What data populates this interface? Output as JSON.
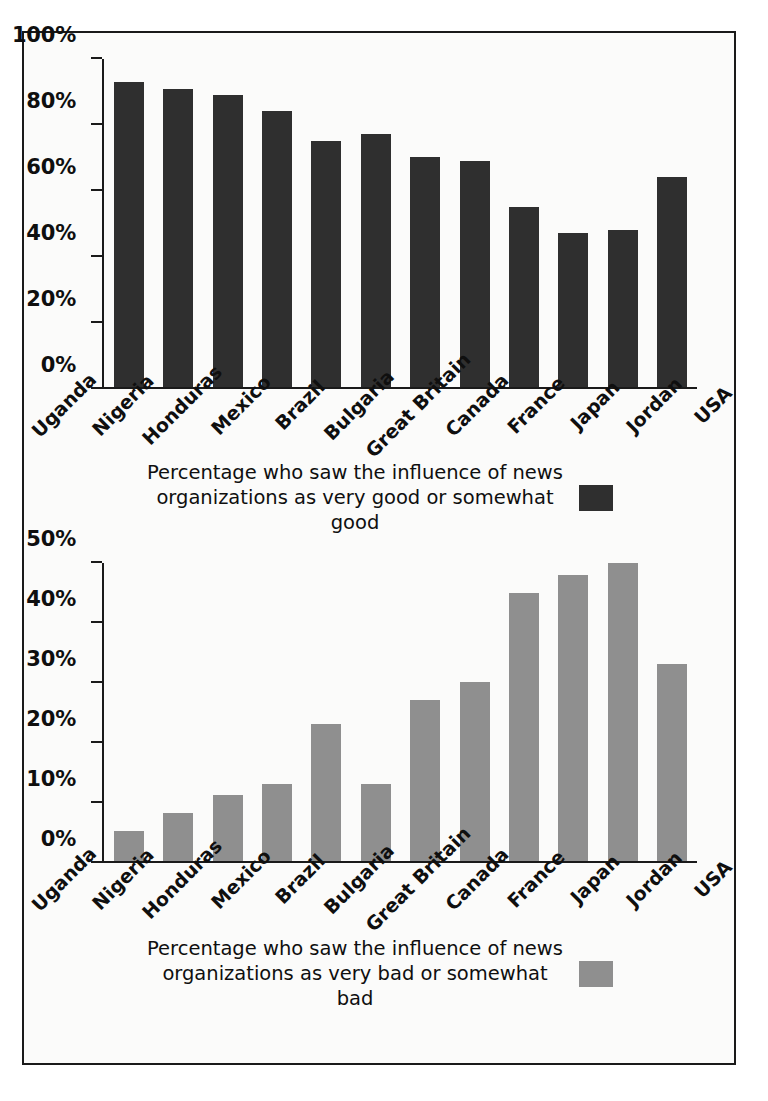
{
  "figure": {
    "background_color": "#fbfbfa",
    "border_color": "#1a1a1a"
  },
  "colors": {
    "series_good": "#2f2f2f",
    "series_bad": "#8f8f8f",
    "text": "#0f0f0f"
  },
  "legends": {
    "top_line1": "Percentage who saw the influence of news",
    "top_line2": "organizations as very good or somewhat good",
    "bottom_line1": "Percentage who saw the influence of news",
    "bottom_line2": "organizations as very bad or somewhat bad"
  },
  "chart_data": [
    {
      "type": "bar",
      "title": "",
      "xlabel": "",
      "ylabel": "",
      "ylim": [
        0,
        100
      ],
      "ytick_labels": [
        "100%",
        "80%",
        "60%",
        "40%",
        "20%",
        "0%"
      ],
      "ytick_values": [
        100,
        80,
        60,
        40,
        20,
        0
      ],
      "grid": false,
      "legend_position": "below",
      "legend_label": "Percentage who saw the influence of news organizations as very good or somewhat good",
      "bar_color": "#2f2f2f",
      "categories": [
        "Uganda",
        "Nigeria",
        "Honduras",
        "Mexico",
        "Brazil",
        "Bulgaria",
        "Great Britain",
        "Canada",
        "France",
        "Japan",
        "Jordan",
        "USA"
      ],
      "values": [
        93,
        91,
        89,
        84,
        75,
        77,
        70,
        69,
        55,
        47,
        48,
        64
      ]
    },
    {
      "type": "bar",
      "title": "",
      "xlabel": "",
      "ylabel": "",
      "ylim": [
        0,
        50
      ],
      "ytick_labels": [
        "50%",
        "40%",
        "30%",
        "20%",
        "10%",
        "0%"
      ],
      "ytick_values": [
        50,
        40,
        30,
        20,
        10,
        0
      ],
      "grid": false,
      "legend_position": "below",
      "legend_label": "Percentage who saw the influence of news organizations as very bad or somewhat bad",
      "bar_color": "#8f8f8f",
      "categories": [
        "Uganda",
        "Nigeria",
        "Honduras",
        "Mexico",
        "Brazil",
        "Bulgaria",
        "Great Britain",
        "Canada",
        "France",
        "Japan",
        "Jordan",
        "USA"
      ],
      "values": [
        5,
        8,
        11,
        13,
        23,
        13,
        27,
        30,
        45,
        48,
        50,
        33
      ]
    }
  ]
}
